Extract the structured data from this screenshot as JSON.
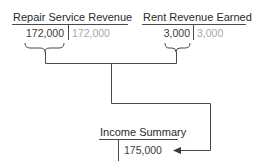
{
  "diagram": {
    "type": "closing-entry-flow",
    "accounts": [
      {
        "name": "Repair Service Revenue",
        "debit": "172,000",
        "credit": "172,000"
      },
      {
        "name": "Rent Revenue Earned",
        "debit": "3,000",
        "credit": "3,000"
      }
    ],
    "target_account": {
      "name": "Income Summary",
      "credit": "175,000"
    },
    "colors": {
      "line": "#4a4a4a",
      "text": "#2a2a2a",
      "closed_amount": "#a8a8a8"
    }
  }
}
